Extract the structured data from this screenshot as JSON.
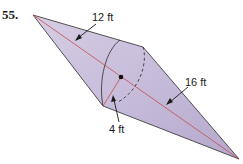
{
  "problem": {
    "number": "55."
  },
  "figure": {
    "labels": {
      "left_cone_slant": "12 ft",
      "right_cone_slant": "16 ft",
      "radius": "4 ft"
    },
    "colors": {
      "fill": "#c9bedb",
      "fill_dark": "#b3a6cc",
      "outline": "#2b2b2b",
      "axis": "#c0504d"
    }
  }
}
